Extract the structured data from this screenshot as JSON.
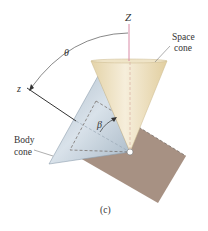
{
  "figure": {
    "caption": "(c)",
    "labels": {
      "space_axis": "Z",
      "body_axis": "z",
      "nutation_angle": "θ",
      "half_angle": "β",
      "space_cone_line1": "Space",
      "space_cone_line2": "cone",
      "body_cone_line1": "Body",
      "body_cone_line2": "cone"
    },
    "colors": {
      "space_cone": "#eadcb8",
      "body_cone": "#b9c7d3",
      "plane": "#9d8576",
      "space_axis": "#d98aa6",
      "text": "#333333"
    }
  }
}
